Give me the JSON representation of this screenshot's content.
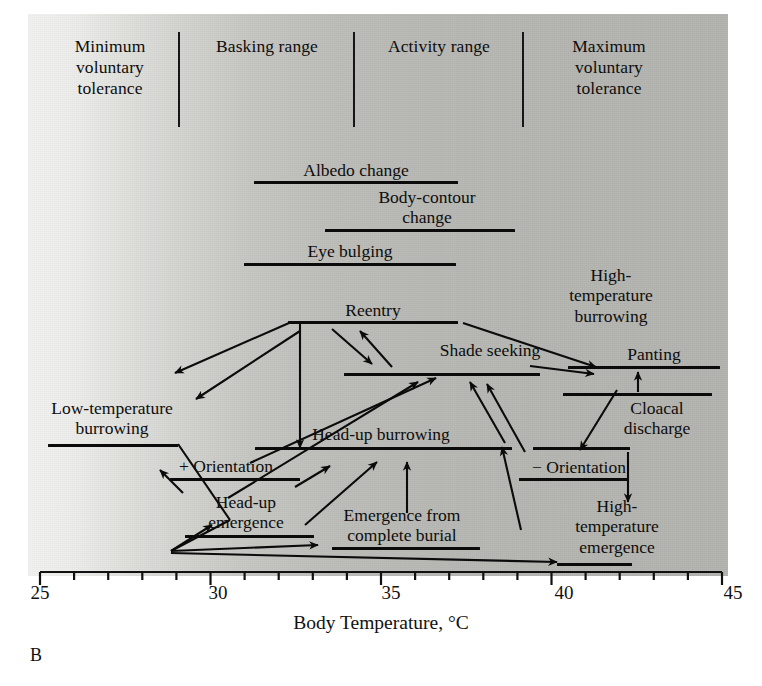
{
  "figure": {
    "caption": "B",
    "axis": {
      "title": "Body Temperature, °C",
      "ticks": [
        "25",
        "30",
        "35",
        "40",
        "45"
      ],
      "min": 25,
      "max": 45,
      "minor_tick_step": 1
    },
    "categories": [
      {
        "name": "minimum-voluntary-tolerance",
        "label": "Minimum\nvoluntary\ntolerance"
      },
      {
        "name": "basking-range",
        "label": "Basking range"
      },
      {
        "name": "activity-range",
        "label": "Activity range"
      },
      {
        "name": "maximum-voluntary-tolerance",
        "label": "Maximum\nvoluntary\ntolerance"
      }
    ],
    "behaviors": [
      {
        "name": "albedo-change",
        "label": "Albedo change",
        "start": 31.3,
        "end": 37.0
      },
      {
        "name": "body-contour-change",
        "label": "Body-contour\nchange",
        "start": 33.3,
        "end": 38.6
      },
      {
        "name": "eye-bulging",
        "label": "Eye bulging",
        "start": 31.0,
        "end": 36.9
      },
      {
        "name": "reentry",
        "label": "Reentry",
        "start": 32.2,
        "end": 36.9
      },
      {
        "name": "shade-seeking",
        "label": "Shade seeking",
        "start": 33.8,
        "end": 39.3
      },
      {
        "name": "high-temperature-burrowing",
        "label": "High-\ntemperature\nburrowing",
        "start": 39.2,
        "end": 41.9
      },
      {
        "name": "panting",
        "label": "Panting",
        "start": 40.1,
        "end": 44.2
      },
      {
        "name": "cloacal-discharge",
        "label": "Cloacal\ndischarge",
        "start": 39.9,
        "end": 43.9
      },
      {
        "name": "low-temperature-burrowing",
        "label": "Low-temperature\nburrowing",
        "start": 25.3,
        "end": 29.6
      },
      {
        "name": "head-up-burrowing",
        "label": "Head-up burrowing",
        "start": 31.1,
        "end": 38.3
      },
      {
        "name": "plus-orientation",
        "label": "+ Orientation",
        "start": 29.2,
        "end": 33.3
      },
      {
        "name": "minus-orientation",
        "label": "− Orientation",
        "start": 38.3,
        "end": 41.6
      },
      {
        "name": "head-up-emergence",
        "label": "Head-up\nemergence",
        "start": 29.5,
        "end": 33.1
      },
      {
        "name": "emergence-from-complete-burial",
        "label": "Emergence from\ncomplete burial",
        "start": 33.4,
        "end": 37.6
      },
      {
        "name": "high-temperature-emergence",
        "label": "High-\ntemperature\nemergence",
        "start": 40.6,
        "end": 42.7
      }
    ]
  }
}
